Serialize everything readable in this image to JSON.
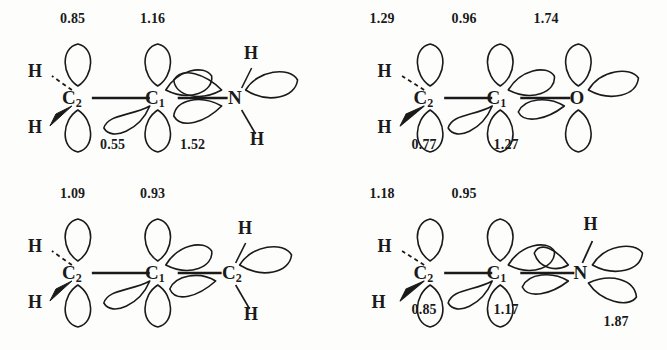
{
  "figure": {
    "type": "orbital-diagram-grid",
    "background_color": "#fdfdfc",
    "ink_color": "#1a1a1a",
    "rows": 2,
    "columns": 2
  },
  "panels": [
    {
      "id": "panel-top-left",
      "position": "top-left",
      "terminal_atom": "N",
      "atoms": {
        "left": {
          "symbol": "C",
          "subscript": "2"
        },
        "center": {
          "symbol": "C",
          "subscript": "1"
        },
        "right": {
          "symbol": "N",
          "subscript": ""
        }
      },
      "hydrogens": {
        "left_upper": "H",
        "left_lower": "H",
        "right_upper": "H",
        "right_lower": "H"
      },
      "values_above": [
        "0.85",
        "1.16"
      ],
      "values_below": [
        "0.55",
        "1.52"
      ]
    },
    {
      "id": "panel-top-right",
      "position": "top-right",
      "terminal_atom": "O",
      "atoms": {
        "left": {
          "symbol": "C",
          "subscript": "2"
        },
        "center": {
          "symbol": "C",
          "subscript": "1"
        },
        "right": {
          "symbol": "O",
          "subscript": ""
        }
      },
      "hydrogens": {
        "left_upper": "H",
        "left_lower": "H"
      },
      "values_above": [
        "1.29",
        "0.96",
        "1.74"
      ],
      "values_below": [
        "0.77",
        "1.27"
      ]
    },
    {
      "id": "panel-bottom-left",
      "position": "bottom-left",
      "terminal_atom": "C",
      "atoms": {
        "left": {
          "symbol": "C",
          "subscript": "2"
        },
        "center": {
          "symbol": "C",
          "subscript": "1"
        },
        "right": {
          "symbol": "C",
          "subscript": "2"
        }
      },
      "hydrogens": {
        "left_upper": "H",
        "left_lower": "H",
        "right_upper": "H",
        "right_lower": "H"
      },
      "values_above": [
        "1.09",
        "0.93"
      ],
      "values_below": []
    },
    {
      "id": "panel-bottom-right",
      "position": "bottom-right",
      "terminal_atom": "N",
      "atoms": {
        "left": {
          "symbol": "C",
          "subscript": "2"
        },
        "center": {
          "symbol": "C",
          "subscript": "1"
        },
        "right": {
          "symbol": "N",
          "subscript": ""
        }
      },
      "hydrogens": {
        "left_upper": "H",
        "left_lower": "H",
        "right_upper": "H"
      },
      "values_above": [
        "1.18",
        "0.95"
      ],
      "values_below": [
        "0.85",
        "1.17",
        "1.87"
      ]
    }
  ]
}
